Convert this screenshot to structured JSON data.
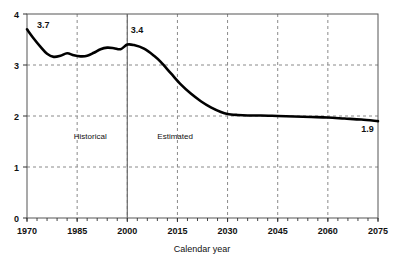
{
  "chart_data": {
    "type": "line",
    "title": "",
    "xlabel": "Calendar year",
    "ylabel": "",
    "xlim": [
      1970,
      2075
    ],
    "ylim": [
      0,
      4
    ],
    "xticks": [
      1970,
      1985,
      2000,
      2015,
      2030,
      2045,
      2060,
      2075
    ],
    "xtick_labels": [
      "1970",
      "1985",
      "2000",
      "2015",
      "2030",
      "2045",
      "2060",
      "2075"
    ],
    "yticks": [
      0,
      1,
      2,
      3,
      4
    ],
    "ytick_labels": [
      "0",
      "1",
      "2",
      "3",
      "4"
    ],
    "minor_xtick_step": 3,
    "grid": "dashed vertical at xticks, dashed horizontal at y=1,2,3",
    "legend": "none",
    "divider_year": 2000,
    "divider_style": "solid vertical line",
    "annotations": [
      {
        "name": "historical-label",
        "text": "Historical",
        "x": 1984,
        "y": 1.55
      },
      {
        "name": "estimated-label",
        "text": "Estimated",
        "x": 2009,
        "y": 1.55
      },
      {
        "name": "start-value-label",
        "text": "3.7",
        "x": 1973,
        "y": 3.72
      },
      {
        "name": "peak-value-label",
        "text": "3.4",
        "x": 2001,
        "y": 3.62
      },
      {
        "name": "end-value-label",
        "text": "1.9",
        "x": 2070,
        "y": 1.68
      }
    ],
    "series": [
      {
        "name": "Total fertility rate",
        "x": [
          1970,
          1972,
          1974,
          1976,
          1978,
          1980,
          1982,
          1984,
          1986,
          1988,
          1990,
          1992,
          1994,
          1996,
          1998,
          2000,
          2002,
          2005,
          2008,
          2010,
          2013,
          2016,
          2019,
          2022,
          2025,
          2028,
          2030,
          2033,
          2036,
          2040,
          2045,
          2050,
          2055,
          2060,
          2065,
          2070,
          2075
        ],
        "values": [
          3.7,
          3.52,
          3.36,
          3.22,
          3.16,
          3.18,
          3.23,
          3.19,
          3.17,
          3.18,
          3.24,
          3.31,
          3.34,
          3.33,
          3.31,
          3.4,
          3.39,
          3.32,
          3.18,
          3.06,
          2.84,
          2.62,
          2.44,
          2.29,
          2.17,
          2.08,
          2.04,
          2.02,
          2.01,
          2.01,
          2.0,
          1.99,
          1.98,
          1.97,
          1.95,
          1.93,
          1.9
        ]
      }
    ]
  }
}
